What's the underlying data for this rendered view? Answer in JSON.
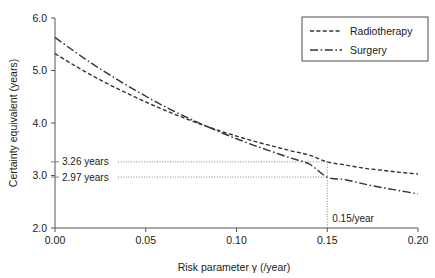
{
  "chart_data": {
    "type": "line",
    "title": "",
    "xlabel": "Risk parameter γ (/year)",
    "ylabel": "Certainty equivalent (years)",
    "xlim": [
      0.0,
      0.2
    ],
    "ylim": [
      2.0,
      6.0
    ],
    "grid": false,
    "legend_position": "top-right",
    "xticks": [
      "0.00",
      "0.05",
      "0.10",
      "0.15",
      "0.20"
    ],
    "xtick_values": [
      0.0,
      0.05,
      0.1,
      0.15,
      0.2
    ],
    "yticks": [
      "2.0",
      "3.0",
      "4.0",
      "5.0",
      "6.0"
    ],
    "ytick_values": [
      2.0,
      3.0,
      4.0,
      5.0,
      6.0
    ],
    "x": [
      0.0,
      0.01,
      0.02,
      0.03,
      0.04,
      0.05,
      0.06,
      0.07,
      0.08,
      0.09,
      0.1,
      0.11,
      0.12,
      0.13,
      0.14,
      0.15,
      0.16,
      0.17,
      0.18,
      0.19,
      0.2
    ],
    "series": [
      {
        "name": "Radiotherapy",
        "line_style": "dashed",
        "color": "#333333",
        "values": [
          5.32,
          5.11,
          4.91,
          4.73,
          4.56,
          4.4,
          4.25,
          4.11,
          3.98,
          3.86,
          3.75,
          3.65,
          3.56,
          3.47,
          3.39,
          3.26,
          3.2,
          3.14,
          3.1,
          3.06,
          3.03
        ]
      },
      {
        "name": "Surgery",
        "line_style": "dash-dot",
        "color": "#333333",
        "values": [
          5.63,
          5.38,
          5.14,
          4.92,
          4.71,
          4.51,
          4.32,
          4.15,
          3.99,
          3.84,
          3.7,
          3.57,
          3.45,
          3.33,
          3.22,
          2.97,
          2.92,
          2.84,
          2.77,
          2.71,
          2.65
        ]
      }
    ],
    "annotations": [
      {
        "name": "radiotherapy-value",
        "label": "3.26 years",
        "y_value": 3.26,
        "x_value": 0.15,
        "style": "dotted-horizontal-leader"
      },
      {
        "name": "surgery-value",
        "label": "2.97 years",
        "y_value": 2.97,
        "x_value": 0.15,
        "style": "dotted-horizontal-leader"
      },
      {
        "name": "risk-parameter-marker",
        "label": "0.15/year",
        "x_value": 0.15,
        "style": "dotted-vertical-marker"
      }
    ]
  },
  "legend": {
    "entries": [
      {
        "label": "Radiotherapy"
      },
      {
        "label": "Surgery"
      }
    ]
  },
  "axes": {
    "x_title": "Risk parameter γ (/year)",
    "y_title": "Certainty equivalent (years)",
    "x_tick_labels": [
      "0.00",
      "0.05",
      "0.10",
      "0.15",
      "0.20"
    ],
    "y_tick_labels": [
      "2.0",
      "3.0",
      "4.0",
      "5.0",
      "6.0"
    ]
  },
  "annotations": {
    "radiotherapy_value_label": "3.26 years",
    "surgery_value_label": "2.97 years",
    "risk_marker_label": "0.15/year"
  },
  "colors": {
    "curve": "#333333",
    "axis": "#555555",
    "guide": "#777777",
    "text": "#1a1a1a",
    "background": "#ffffff"
  }
}
